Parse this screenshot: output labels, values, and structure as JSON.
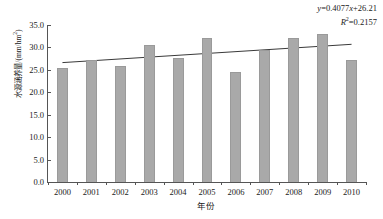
{
  "chart_data": {
    "type": "bar",
    "title": "",
    "xlabel": "年份",
    "ylabel": "水源涵养量/(mm/hm",
    "ylabel_sup": "2",
    "ylabel_tail": ")",
    "categories": [
      "2000",
      "2001",
      "2002",
      "2003",
      "2004",
      "2005",
      "2006",
      "2007",
      "2008",
      "2009",
      "2010"
    ],
    "values": [
      25.4,
      27.1,
      25.9,
      30.5,
      27.6,
      32.1,
      24.6,
      29.5,
      32.0,
      33.0,
      27.1
    ],
    "yticks": [
      "0.0",
      "5.0",
      "10.0",
      "15.0",
      "20.0",
      "25.0",
      "30.0",
      "35.0"
    ],
    "ytickvals": [
      0,
      5,
      10,
      15,
      20,
      25,
      30,
      35
    ],
    "ylim": [
      0,
      35
    ],
    "grid": false,
    "legend": "none",
    "series_name": "水源涵养量",
    "bar_color": "#a9a9a9",
    "trendline": {
      "type": "linear",
      "slope": 0.4077,
      "intercept": 26.21,
      "r_squared": 0.2157,
      "color": "#3a3a3a",
      "start_value": 26.62,
      "end_value": 30.69
    },
    "annotation": {
      "equation_prefix": "y",
      "equation_body": "=0.4077",
      "equation_x": "x",
      "equation_suffix": "+26.21",
      "r_label": "R",
      "r_sup": "2",
      "r_value": "=0.2157"
    }
  }
}
